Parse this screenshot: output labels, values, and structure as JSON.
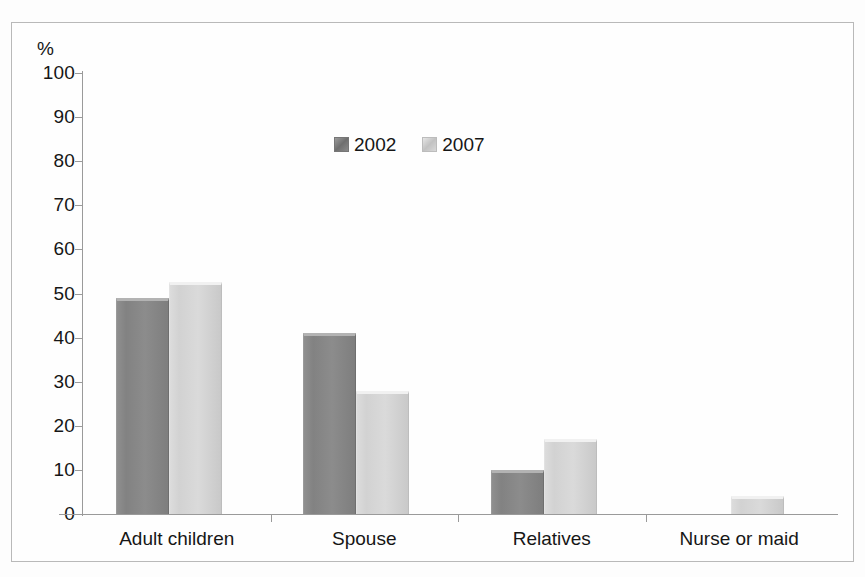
{
  "chart_data": {
    "type": "bar",
    "title": "",
    "subtitle": "",
    "xlabel": "",
    "ylabel": "%",
    "ylim": [
      0,
      100
    ],
    "ytick_labels": [
      "100",
      "90",
      "80",
      "70",
      "60",
      "50",
      "40",
      "30",
      "20",
      "10",
      "0"
    ],
    "yticks": [
      100,
      90,
      80,
      70,
      60,
      50,
      40,
      30,
      20,
      10,
      0
    ],
    "grid": false,
    "legend_position": "top-center",
    "categories": [
      "Adult children",
      "Spouse",
      "Relatives",
      "Nurse or maid"
    ],
    "series": [
      {
        "name": "2002",
        "color": "#8a8a8a",
        "values": [
          49,
          41,
          10,
          0
        ]
      },
      {
        "name": "2007",
        "color": "#d5d5d5",
        "values": [
          52.5,
          28,
          17,
          4
        ]
      }
    ]
  },
  "axis": {
    "unit_label": "%"
  },
  "legend": {
    "items": [
      {
        "label": "2002",
        "swatch": "legend-swatch-2002"
      },
      {
        "label": "2007",
        "swatch": "legend-swatch-2007"
      }
    ]
  },
  "colors": {
    "series_2002": "#8a8a8a",
    "series_2007": "#d5d5d5",
    "axis": "#9a9a9a",
    "border": "#b9b9b9",
    "text": "#161616",
    "background": "#fdfdfd"
  }
}
